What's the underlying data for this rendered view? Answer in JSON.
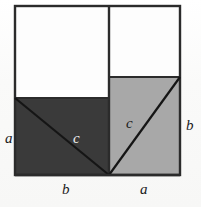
{
  "figure": {
    "caption": "",
    "background_color": "#fbfbfa",
    "outline_color": "#2b2b2b",
    "dark_fill": "#3a3a3a",
    "light_fill": "#a8a8a8",
    "white_fill": "#fdfdfd"
  },
  "geometry": {
    "frame": {
      "left": 15,
      "top": 6,
      "right": 180,
      "bottom": 175
    },
    "divider_x": 109,
    "dark_square_top": 98,
    "light_square_top": 77,
    "apex": {
      "x": 109,
      "y": 175
    }
  },
  "labels": {
    "left_side": "a",
    "right_side": "b",
    "bottom_left": "b",
    "bottom_right": "a",
    "hypotenuse_left": "c",
    "hypotenuse_right": "c"
  },
  "regions": [
    {
      "name": "upper-left-white-rectangle",
      "fill": "#fdfdfd"
    },
    {
      "name": "upper-right-white-rectangle",
      "fill": "#fdfdfd"
    },
    {
      "name": "dark-square-side-b",
      "fill": "#3a3a3a"
    },
    {
      "name": "light-square-side-a",
      "fill": "#a8a8a8"
    }
  ],
  "bleed_through": {
    "line1": "THE WONDERFUL",
    "line2": "OF ANCIENT"
  }
}
